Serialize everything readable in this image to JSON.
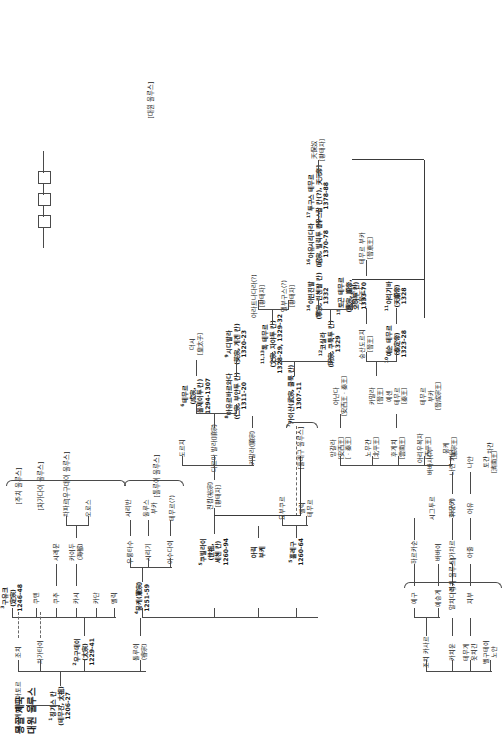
{
  "title": {
    "line1": "몽골 제국",
    "line2": "대원 울루스"
  },
  "group_labels": [
    {
      "id": "jochi",
      "text": "[주치 울루스]"
    },
    {
      "id": "chagatai",
      "text": "[차가다이 울루스]"
    },
    {
      "id": "ogodei",
      "text": "[우구데이 울루스]"
    },
    {
      "id": "tolui",
      "text": "[톨루이 울루스]"
    },
    {
      "id": "hulegu",
      "text": "[훌레구 울루스]"
    },
    {
      "id": "dayuan",
      "text": "[대원 울루스]"
    },
    {
      "id": "jochi2",
      "text": "[주치 울루스]"
    }
  ],
  "nodes": [
    {
      "id": "n_jesugei",
      "lines": [
        "예수게이 바아토르"
      ]
    },
    {
      "id": "n_chinggis",
      "num": "1",
      "lines": [
        "칭기스 칸",
        "(테무진, 太祖)",
        "1206-27"
      ],
      "bold": true
    },
    {
      "id": "n_jochi",
      "lines": [
        "조치"
      ]
    },
    {
      "id": "n_chagatai",
      "lines": [
        "차가타이"
      ]
    },
    {
      "id": "n_ogodei",
      "num": "2",
      "lines": [
        "우구데이",
        "(太宗)",
        "1229-41"
      ],
      "bold": true
    },
    {
      "id": "n_tolui",
      "lines": [
        "톨루이",
        "(睿宗)"
      ]
    },
    {
      "id": "n_guyug",
      "num": "3",
      "lines": [
        "구유크",
        "(定宗)",
        "1246-48"
      ],
      "bold": true
    },
    {
      "id": "n_kodon",
      "lines": [
        "쿠텐"
      ]
    },
    {
      "id": "n_kochu",
      "lines": [
        "쿠추"
      ]
    },
    {
      "id": "n_karachar",
      "lines": [
        "카시"
      ]
    },
    {
      "id": "n_kadan",
      "lines": [
        "카단"
      ]
    },
    {
      "id": "n_melik",
      "lines": [
        "멜릭"
      ]
    },
    {
      "id": "n_shiremun",
      "lines": [
        "시레문"
      ]
    },
    {
      "id": "n_kaidu",
      "lines": [
        "카이두",
        "(海都)"
      ]
    },
    {
      "id": "n_chabar",
      "lines": [
        "차파르"
      ]
    },
    {
      "id": "n_oros",
      "lines": [
        "오로스"
      ]
    },
    {
      "id": "n_mongke",
      "num": "4",
      "lines": [
        "뭉케(憲宗)",
        "1251-59"
      ],
      "bold": true
    },
    {
      "id": "n_asutai",
      "lines": [
        "아수다이"
      ]
    },
    {
      "id": "n_shiregi",
      "lines": [
        "시리기"
      ]
    },
    {
      "id": "n_urungtash",
      "lines": [
        "우룽타수"
      ]
    },
    {
      "id": "n_temur_q",
      "lines": [
        "테무르(?)"
      ]
    },
    {
      "id": "n_ulus_buka",
      "lines": [
        "울루스",
        "부카"
      ]
    },
    {
      "id": "n_shiriban",
      "lines": [
        "시리반"
      ]
    },
    {
      "id": "n_kubilai",
      "num": "5",
      "lines": [
        "쿠빌라이",
        "(世祖,",
        "세첸 칸)",
        "1260-94"
      ],
      "bold": true
    },
    {
      "id": "n_hulegu",
      "num": "5",
      "lines": [
        "훌레구",
        "1260-64"
      ],
      "bold": true
    },
    {
      "id": "n_ariq",
      "lines": [
        "아릭",
        "부케"
      ],
      "bold": true
    },
    {
      "id": "n_yobuqur",
      "lines": [
        "요부쿠르"
      ]
    },
    {
      "id": "n_melik_t",
      "lines": [
        "멜릭",
        "테무르"
      ]
    },
    {
      "id": "n_chinkim",
      "lines": [
        "친킴(裕宗)",
        "[황태자]"
      ]
    },
    {
      "id": "n_dorji",
      "lines": [
        "도르지"
      ]
    },
    {
      "id": "n_darmabala",
      "lines": [
        "다르마 발라(順宗)"
      ]
    },
    {
      "id": "n_kammala",
      "lines": [
        "카말라(顯宗)"
      ]
    },
    {
      "id": "n_temur",
      "num": "6",
      "lines": [
        "테무르",
        "(成宗,",
        "올제이투 칸)",
        "1294-1307"
      ],
      "bold": true
    },
    {
      "id": "n_deshi",
      "lines": [
        "더시",
        "[皇太子]"
      ]
    },
    {
      "id": "n_ayurbarwada",
      "num": "8",
      "lines": [
        "아유르바르와다",
        "(仁宗, 부얀투 칸)",
        "1311-20"
      ],
      "bold": true
    },
    {
      "id": "n_sidibala",
      "num": "9",
      "lines": [
        "시디발라",
        "(英宗, 게겐 칸)",
        "1320-23"
      ],
      "bold": true
    },
    {
      "id": "n_kaishan",
      "num": "7",
      "lines": [
        "카이샨(武宗, 쿨룩 칸)",
        "1307-11"
      ],
      "bold": true
    },
    {
      "id": "n_kusala",
      "num": "12",
      "lines": [
        "코실라",
        "(明宗, 쿠툭투 칸)",
        "1329"
      ],
      "bold": true
    },
    {
      "id": "n_tugh",
      "num": "11,13",
      "lines": [
        "톡 테무르",
        "(文宗, 자야투 칸)",
        "1328-29, 1329-32"
      ],
      "bold": true
    },
    {
      "id": "n_aratnadara",
      "lines": [
        "아라트나다라(?)",
        "[황태자]"
      ]
    },
    {
      "id": "n_elbugus",
      "lines": [
        "엘부구스(?)",
        "[황태자]"
      ]
    },
    {
      "id": "n_toghon",
      "num": "15",
      "lines": [
        "토곤 테무르",
        "(惠宗, 順帝,",
        "오하투 칸)",
        "1333-70"
      ],
      "bold": true
    },
    {
      "id": "n_irinjibal",
      "num": "14",
      "lines": [
        "이린친발",
        "(寧宗, 린첸팔 칸)",
        "1332"
      ],
      "bold": true
    },
    {
      "id": "n_yesun",
      "num": "10",
      "lines": [
        "예순 테무르",
        "(泰定帝)",
        "1323-28"
      ],
      "bold": true
    },
    {
      "id": "n_arigiba",
      "num": "11",
      "lines": [
        "아리기바",
        "(天順帝)",
        "1328"
      ],
      "bold": true
    },
    {
      "id": "n_kamala2",
      "lines": [
        "카말라",
        "[晉王]"
      ]
    },
    {
      "id": "n_sungsan",
      "lines": [
        "숭산도르지",
        "[晉王]"
      ]
    },
    {
      "id": "n_wangsan",
      "lines": [
        "왕선주왕",
        "[晉王]"
      ]
    },
    {
      "id": "n_temur_bq",
      "lines": [
        "테무르 부카",
        "[晉恵王]"
      ]
    },
    {
      "id": "n_ayushi",
      "num": "16",
      "lines": [
        "아유시리다라",
        "(昭宗, 빌릭투 칸)",
        "1370-78"
      ],
      "bold": true
    },
    {
      "id": "n_tugus",
      "num": "17",
      "lines": [
        "투구스 테무르",
        "[우스칼 칸(?), 天元帝]",
        "1378-88"
      ],
      "bold": true
    },
    {
      "id": "n_tianbao",
      "lines": [
        "天保奴",
        "[황태자]"
      ]
    },
    {
      "id": "n_mongke_b",
      "lines": [
        "뭉케",
        "[憲宗王]"
      ]
    },
    {
      "id": "n_arigboke",
      "lines": [
        "아리우복자",
        "[西平王]"
      ]
    },
    {
      "id": "n_hugechi",
      "lines": [
        "후게치",
        "[雲南王]"
      ]
    },
    {
      "id": "n_nomugan",
      "lines": [
        "노무간",
        "[北平王]"
      ]
    },
    {
      "id": "n_manggala",
      "lines": [
        "망갈라",
        "[安西王]",
        "[ㆍ秦王]"
      ]
    },
    {
      "id": "n_ananda",
      "lines": [
        "아난다",
        "[安西王ㆍ秦王]"
      ]
    },
    {
      "id": "n_yesen",
      "lines": [
        "예센",
        "테무르",
        "[秦王]"
      ]
    },
    {
      "id": "n_temur_buqa",
      "lines": [
        "테무르",
        "부카",
        "[晉成宗王]"
      ]
    },
    {
      "id": "n_baiji",
      "lines": [
        "나얀"
      ]
    },
    {
      "id": "n_gerege",
      "lines": [
        "벨구테이",
        "노얀"
      ]
    },
    {
      "id": "n_kasar",
      "lines": [
        "조치 카사르"
      ]
    },
    {
      "id": "n_hachiun",
      "lines": [
        "카치운"
      ]
    },
    {
      "id": "n_temuge",
      "lines": [
        "테무게",
        "옷치긴"
      ]
    },
    {
      "id": "n_yegu",
      "lines": [
        "예구"
      ]
    },
    {
      "id": "n_yesunge",
      "lines": [
        "예승게"
      ]
    },
    {
      "id": "n_harqasun",
      "lines": [
        "하르카순"
      ]
    },
    {
      "id": "n_babai",
      "lines": [
        "바바이"
      ]
    },
    {
      "id": "n_altan",
      "lines": [
        "알치다이"
      ]
    },
    {
      "id": "n_jibuk",
      "lines": [
        "지부"
      ]
    },
    {
      "id": "n_taga",
      "lines": [
        "타가차르"
      ]
    },
    {
      "id": "n_ajul",
      "lines": [
        "아줄"
      ]
    },
    {
      "id": "n_jinggun",
      "lines": [
        "자군카"
      ]
    },
    {
      "id": "n_hula",
      "lines": [
        "후라(?)"
      ]
    },
    {
      "id": "n_najin",
      "lines": [
        "나린 카단"
      ]
    },
    {
      "id": "n_sigtur",
      "lines": [
        "시그투르"
      ]
    },
    {
      "id": "n_basar",
      "lines": [
        "바바사(?)"
      ]
    },
    {
      "id": "n_ayu2",
      "lines": [
        "아유"
      ]
    },
    {
      "id": "n_nayan2",
      "lines": [
        "나얀"
      ]
    },
    {
      "id": "n_toqan",
      "lines": [
        "토간",
        "[濟南王]"
      ]
    },
    {
      "id": "n_chakan",
      "lines": [
        "차간"
      ]
    }
  ],
  "boxes_count": 3,
  "colors": {
    "line": "#4a4a4a",
    "text": "#1a1a1a",
    "background": "#ffffff"
  }
}
